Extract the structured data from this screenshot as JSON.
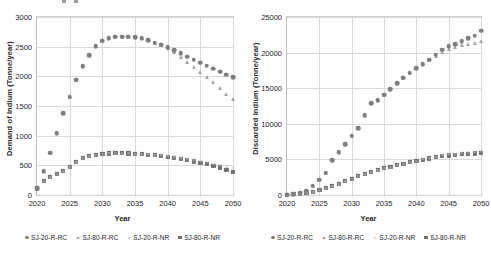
{
  "figure": {
    "background": "#ffffff",
    "marker_colors": {
      "SJ-20-R-RC": "#7f7f7f",
      "SJ-80-R-RC": "#a6a6a6",
      "SJ-20-R-NR": "#bfbfbf",
      "SJ-80-R-NR": "#707070"
    },
    "gridline_color": "#d9d9d9",
    "axis_color": "#bdbdbd"
  },
  "chart_data": [
    {
      "type": "scatter",
      "panel": "left",
      "title": "",
      "xlabel": "Year",
      "ylabel": "Demand of Indium (Tonne/year)",
      "xlim": [
        2020,
        2050
      ],
      "ylim": [
        0,
        3000
      ],
      "xticks": [
        2020,
        2025,
        2030,
        2035,
        2040,
        2045,
        2050
      ],
      "yticks": [
        0,
        500,
        1000,
        1500,
        2000,
        2500,
        3000
      ],
      "grid": true,
      "legend_position": "bottom",
      "x": [
        2020,
        2021,
        2022,
        2023,
        2024,
        2025,
        2026,
        2027,
        2028,
        2029,
        2030,
        2031,
        2032,
        2033,
        2034,
        2035,
        2036,
        2037,
        2038,
        2039,
        2040,
        2041,
        2042,
        2043,
        2044,
        2045,
        2046,
        2047,
        2048,
        2049,
        2050
      ],
      "series": [
        {
          "name": "SJ-20-R-RC",
          "marker": "circle",
          "color": "#7f7f7f",
          "values": [
            110,
            400,
            710,
            1040,
            1380,
            1660,
            1940,
            2170,
            2360,
            2510,
            2600,
            2645,
            2665,
            2670,
            2670,
            2660,
            2640,
            2610,
            2570,
            2530,
            2490,
            2440,
            2390,
            2330,
            2280,
            2230,
            2180,
            2130,
            2080,
            2030,
            1990
          ]
        },
        {
          "name": "SJ-80-R-RC",
          "marker": "triangle",
          "color": "#a6a6a6",
          "values": [
            110,
            400,
            710,
            1040,
            1380,
            1660,
            1940,
            2170,
            2360,
            2510,
            2600,
            2645,
            2665,
            2670,
            2670,
            2660,
            2640,
            2610,
            2570,
            2525,
            2475,
            2410,
            2330,
            2250,
            2160,
            2080,
            1990,
            1900,
            1810,
            1710,
            1610
          ]
        },
        {
          "name": "SJ-20-R-NR",
          "marker": "cross",
          "color": "#bfbfbf",
          "values": [
            110,
            240,
            310,
            360,
            400,
            480,
            560,
            620,
            660,
            680,
            695,
            700,
            703,
            703,
            700,
            697,
            692,
            685,
            678,
            668,
            655,
            640,
            622,
            604,
            588,
            570,
            550,
            528,
            505,
            478,
            450
          ]
        },
        {
          "name": "SJ-80-R-NR",
          "marker": "square",
          "color": "#707070",
          "values": [
            110,
            240,
            310,
            360,
            400,
            480,
            560,
            620,
            660,
            680,
            695,
            700,
            703,
            703,
            700,
            697,
            690,
            682,
            672,
            660,
            645,
            628,
            608,
            586,
            565,
            542,
            518,
            492,
            465,
            428,
            390
          ]
        }
      ]
    },
    {
      "type": "scatter",
      "panel": "right",
      "title": "",
      "xlabel": "Year",
      "ylabel": "Discarded Indium (Tonne/year)",
      "xlim": [
        2020,
        2050
      ],
      "ylim": [
        0,
        25000
      ],
      "xticks": [
        2020,
        2025,
        2030,
        2035,
        2040,
        2045,
        2050
      ],
      "yticks": [
        0,
        5000,
        10000,
        15000,
        20000,
        25000
      ],
      "grid": true,
      "legend_position": "bottom",
      "x": [
        2020,
        2021,
        2022,
        2023,
        2024,
        2025,
        2026,
        2027,
        2028,
        2029,
        2030,
        2031,
        2032,
        2033,
        2034,
        2035,
        2036,
        2037,
        2038,
        2039,
        2040,
        2041,
        2042,
        2043,
        2044,
        2045,
        2046,
        2047,
        2048,
        2049,
        2050
      ],
      "series": [
        {
          "name": "SJ-20-R-RC",
          "marker": "circle",
          "color": "#7f7f7f",
          "values": [
            60,
            150,
            320,
            620,
            1300,
            2150,
            3150,
            4900,
            6050,
            7150,
            8300,
            9350,
            11200,
            12900,
            13300,
            14100,
            14900,
            15700,
            16500,
            17200,
            17800,
            18400,
            19000,
            19700,
            20400,
            20900,
            21200,
            21600,
            22000,
            22400,
            23100
          ]
        },
        {
          "name": "SJ-80-R-RC",
          "marker": "triangle",
          "color": "#a6a6a6",
          "values": [
            60,
            150,
            320,
            620,
            1300,
            2150,
            3150,
            4900,
            6050,
            7150,
            8300,
            9350,
            11200,
            12900,
            13300,
            14100,
            14900,
            15700,
            16500,
            17200,
            17800,
            18350,
            18900,
            19500,
            20100,
            20500,
            20800,
            21000,
            21200,
            21400,
            21600
          ]
        },
        {
          "name": "SJ-20-R-NR",
          "marker": "cross",
          "color": "#bfbfbf",
          "values": [
            60,
            120,
            200,
            320,
            480,
            700,
            950,
            1250,
            1600,
            1950,
            2300,
            2650,
            3000,
            3300,
            3550,
            3800,
            4000,
            4200,
            4400,
            4600,
            4800,
            5000,
            5200,
            5400,
            5550,
            5700,
            5800,
            5900,
            5980,
            6050,
            6150
          ]
        },
        {
          "name": "SJ-80-R-NR",
          "marker": "square",
          "color": "#707070",
          "values": [
            60,
            120,
            200,
            320,
            480,
            700,
            950,
            1250,
            1600,
            1950,
            2300,
            2650,
            3000,
            3300,
            3550,
            3800,
            4000,
            4200,
            4400,
            4600,
            4800,
            4980,
            5150,
            5300,
            5450,
            5550,
            5650,
            5720,
            5780,
            5830,
            5900
          ]
        }
      ]
    }
  ]
}
